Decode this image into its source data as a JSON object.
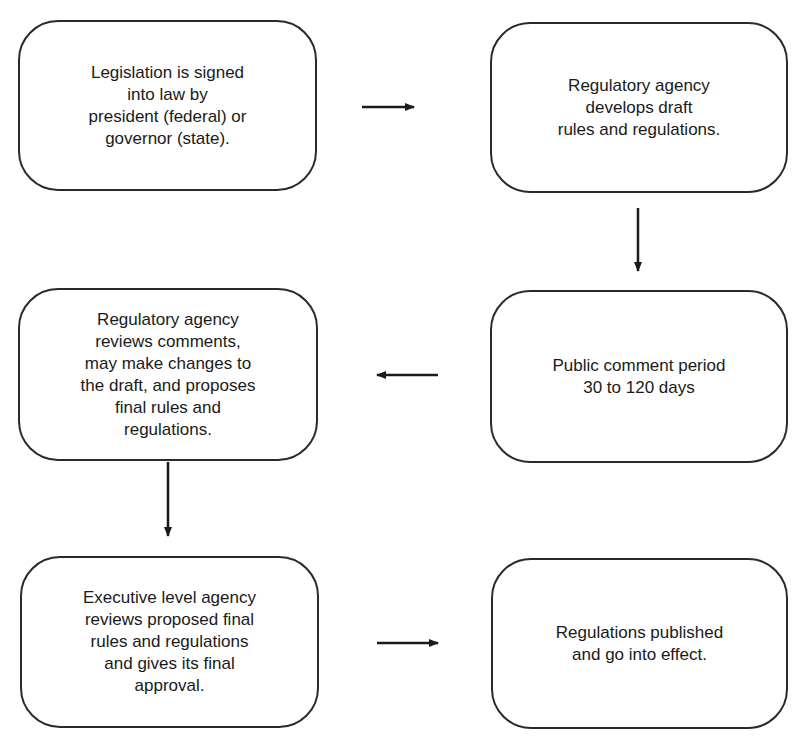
{
  "diagram": {
    "type": "flowchart",
    "steps": [
      {
        "id": 1,
        "text": "Legislation is signed\ninto law by\npresident (federal) or\ngovernor (state)."
      },
      {
        "id": 2,
        "text": "Regulatory agency\ndevelops draft\nrules and regulations."
      },
      {
        "id": 3,
        "text": "Public comment period\n30 to 120 days"
      },
      {
        "id": 4,
        "text": "Regulatory agency\nreviews comments,\nmay make changes to\nthe draft, and proposes\nfinal rules and\nregulations."
      },
      {
        "id": 5,
        "text": "Executive level agency\nreviews proposed final\nrules and regulations\nand gives its final\napproval."
      },
      {
        "id": 6,
        "text": "Regulations published\nand go into effect."
      }
    ],
    "connections": [
      {
        "from": 1,
        "to": 2,
        "direction": "right"
      },
      {
        "from": 2,
        "to": 3,
        "direction": "down"
      },
      {
        "from": 3,
        "to": 4,
        "direction": "left"
      },
      {
        "from": 4,
        "to": 5,
        "direction": "down"
      },
      {
        "from": 5,
        "to": 6,
        "direction": "right"
      }
    ],
    "colors": {
      "stroke": "#2a2a2a",
      "background": "#ffffff",
      "text": "#1a1a1a"
    }
  }
}
